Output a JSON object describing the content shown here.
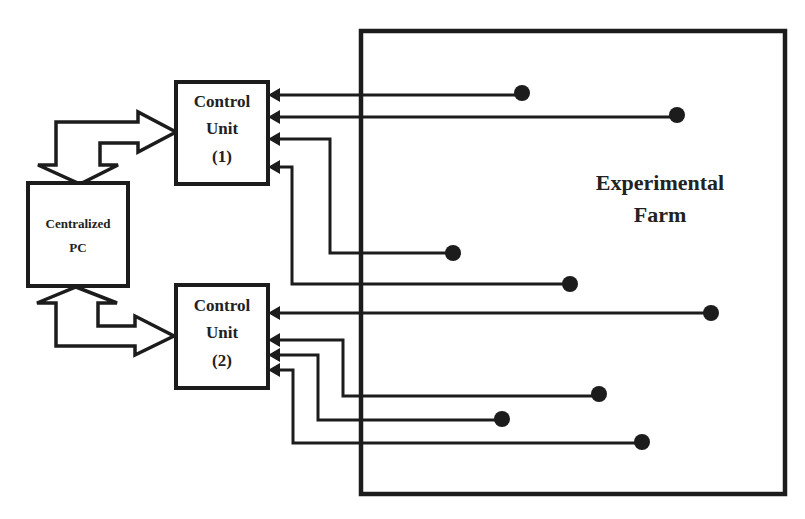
{
  "diagram": {
    "title_region": "Experimental Farm",
    "nodes": {
      "centralized_pc": {
        "line1": "Centralized",
        "line2": "PC"
      },
      "control_unit_1": {
        "line1": "Control",
        "line2": "Unit",
        "line3": "(1)"
      },
      "control_unit_2": {
        "line1": "Control",
        "line2": "Unit",
        "line3": "(2)"
      },
      "farm": {
        "line1": "Experimental",
        "line2": "Farm"
      }
    },
    "connections": [
      {
        "from": "centralized_pc",
        "to": "control_unit_1",
        "type": "bidirectional-bus"
      },
      {
        "from": "centralized_pc",
        "to": "control_unit_2",
        "type": "bidirectional-bus"
      }
    ],
    "sensors": {
      "control_unit_1": [
        {
          "id": 1,
          "dot": [
            522,
            93
          ]
        },
        {
          "id": 2,
          "dot": [
            677,
            115
          ]
        },
        {
          "id": 3,
          "dot": [
            453,
            253
          ]
        },
        {
          "id": 4,
          "dot": [
            570,
            284
          ]
        }
      ],
      "control_unit_2": [
        {
          "id": 5,
          "dot": [
            711,
            313
          ]
        },
        {
          "id": 6,
          "dot": [
            599,
            394
          ]
        },
        {
          "id": 7,
          "dot": [
            502,
            419
          ]
        },
        {
          "id": 8,
          "dot": [
            642,
            442
          ]
        }
      ]
    },
    "colors": {
      "stroke": "#1c1c1c",
      "background": "#ffffff",
      "text": "#222222"
    }
  }
}
